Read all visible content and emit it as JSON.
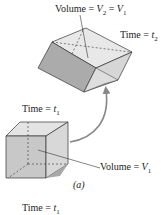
{
  "diagram": {
    "top_shape": {
      "volume_label_prefix": "Volume = ",
      "volume_sym_a": "V",
      "volume_sub_a": "2",
      "volume_mid": " = ",
      "volume_sym_b": "V",
      "volume_sub_b": "1",
      "time_prefix": "Time = ",
      "time_sym": "t",
      "time_sub": "2"
    },
    "bottom_shape": {
      "time_prefix": "Time = ",
      "time_sym": "t",
      "time_sub": "1",
      "volume_label_prefix": "Volume = ",
      "volume_sym": "V",
      "volume_sub": "1"
    },
    "caption": "(a)",
    "footer_time_prefix": "Time = ",
    "footer_time_sym": "t",
    "footer_time_sub": "1",
    "colors": {
      "face_light": "#e6e6e6",
      "face_mid": "#d2d2d2",
      "face_dark": "#b0b0b0",
      "edge": "#333333",
      "arrow": "#888888"
    }
  }
}
